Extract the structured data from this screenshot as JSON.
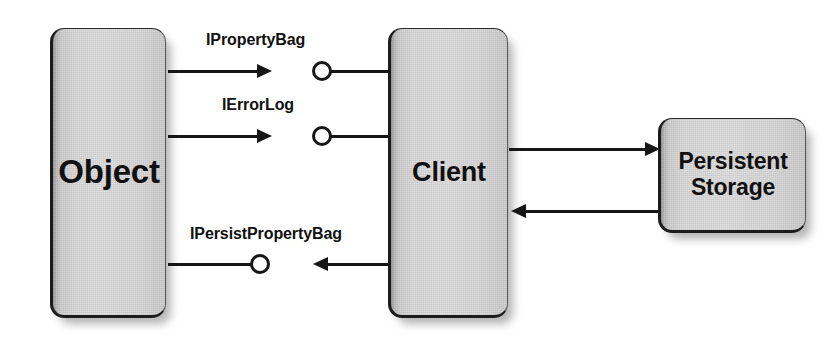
{
  "diagram": {
    "background_color": "#ffffff",
    "line_color": "#161616",
    "box_fill_color": "#e0e0e0",
    "text_color": "#111111",
    "nodes": {
      "object": {
        "label": "Object"
      },
      "client": {
        "label": "Client"
      },
      "storage": {
        "label_line1": "Persistent",
        "label_line2": "Storage"
      }
    },
    "interfaces": [
      {
        "name": "IPropertyBag",
        "from": "Object",
        "to": "Client",
        "direction": "right"
      },
      {
        "name": "IErrorLog",
        "from": "Object",
        "to": "Client",
        "direction": "right"
      },
      {
        "name": "IPersistPropertyBag",
        "from": "Client",
        "to": "Object",
        "direction": "left"
      }
    ],
    "connections": [
      {
        "from": "Client",
        "to": "Persistent Storage",
        "direction": "right"
      },
      {
        "from": "Persistent Storage",
        "to": "Client",
        "direction": "left"
      }
    ]
  }
}
